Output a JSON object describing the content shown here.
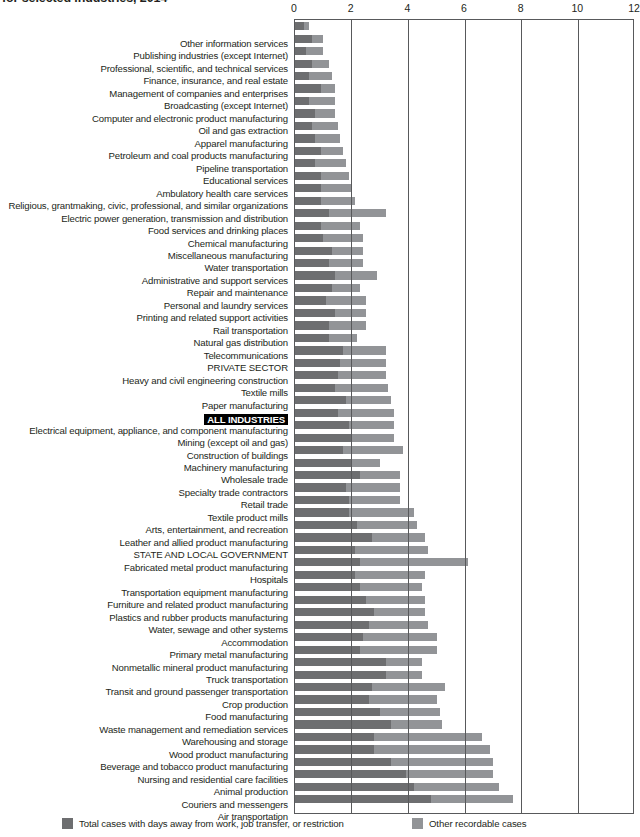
{
  "title": {
    "line_visible": "for selected industries, 2014"
  },
  "legend": {
    "position": "bottom",
    "items": [
      {
        "label": "Total cases with days away from work, job transfer, or restriction",
        "color": "#6d6e70",
        "key": "days_away_transfer_restriction"
      },
      {
        "label": "Other recordable cases",
        "color": "#929497",
        "key": "other_recordable"
      }
    ]
  },
  "axis": {
    "ticks": [
      "0",
      "2",
      "4",
      "6",
      "8",
      "10",
      "12"
    ],
    "min": 0,
    "max": 12,
    "step": 2
  },
  "highlight_category": "ALL INDUSTRIES",
  "chart_data": {
    "type": "bar",
    "orientation": "horizontal",
    "stacked": true,
    "title": "for selected industries, 2014",
    "xlabel": "",
    "ylabel": "",
    "xlim": [
      0,
      12
    ],
    "grid": true,
    "legend_position": "bottom",
    "series": [
      {
        "name": "Total cases with days away from work, job transfer, or restriction",
        "color": "#6d6e70"
      },
      {
        "name": "Other recordable cases",
        "color": "#929497"
      }
    ],
    "categories": [
      "Other information services",
      "Publishing industries (except Internet)",
      "Professional, scientific, and technical services",
      "Finance, insurance, and real estate",
      "Management of companies and enterprises",
      "Broadcasting (except Internet)",
      "Computer and electronic product manufacturing",
      "Oil and gas extraction",
      "Apparel manufacturing",
      "Petroleum and coal products manufacturing",
      "Pipeline transportation",
      "Educational services",
      "Ambulatory health care services",
      "Religious, grantmaking, civic, professional, and similar organizations",
      "Electric power generation, transmission and distribution",
      "Food services and drinking places",
      "Chemical manufacturing",
      "Miscellaneous manufacturing",
      "Water transportation",
      "Administrative and support services",
      "Repair and maintenance",
      "Personal and laundry services",
      "Printing and related support activities",
      "Rail transportation",
      "Natural gas distribution",
      "Telecommunications",
      "PRIVATE SECTOR",
      "Heavy and civil engineering construction",
      "Textile mills",
      "Paper manufacturing",
      "ALL INDUSTRIES",
      "Electrical equipment, appliance, and component manufacturing",
      "Mining (except oil and gas)",
      "Construction of buildings",
      "Machinery manufacturing",
      "Wholesale trade",
      "Specialty trade contractors",
      "Retail trade",
      "Textile product mills",
      "Arts, entertainment, and recreation",
      "Leather and allied product manufacturing",
      "STATE AND LOCAL GOVERNMENT",
      "Fabricated metal product manufacturing",
      "Hospitals",
      "Transportation equipment manufacturing",
      "Furniture and related product manufacturing",
      "Plastics and rubber products manufacturing",
      "Water, sewage and other systems",
      "Accommodation",
      "Primary metal manufacturing",
      "Nonmetallic mineral product manufacturing",
      "Truck transportation",
      "Transit and ground passenger transportation",
      "Crop production",
      "Food manufacturing",
      "Waste management and remediation services",
      "Warehousing and storage",
      "Wood product manufacturing",
      "Beverage and tobacco product manufacturing",
      "Nursing and residential care facilities",
      "Animal production",
      "Couriers and messengers",
      "Air transportation"
    ],
    "values": {
      "days_away_transfer_restriction": [
        0.3,
        0.6,
        0.4,
        0.6,
        0.5,
        0.9,
        0.5,
        0.7,
        0.6,
        0.7,
        0.9,
        0.7,
        0.9,
        0.9,
        0.9,
        1.2,
        0.9,
        1.0,
        1.3,
        1.2,
        1.4,
        1.3,
        1.1,
        1.4,
        1.2,
        1.2,
        1.7,
        1.6,
        1.5,
        1.4,
        1.8,
        1.5,
        1.9,
        2.0,
        1.7,
        2.0,
        2.3,
        1.8,
        1.9,
        1.9,
        2.2,
        2.7,
        2.1,
        2.3,
        2.1,
        2.3,
        2.5,
        2.8,
        2.6,
        2.4,
        2.3,
        3.2,
        3.2,
        2.7,
        2.6,
        3.0,
        3.4,
        2.8,
        2.8,
        3.4,
        3.9,
        4.2,
        4.8
      ],
      "other_recordable": [
        0.2,
        0.4,
        0.6,
        0.6,
        0.8,
        0.5,
        0.9,
        0.7,
        0.9,
        0.9,
        0.8,
        1.1,
        1.0,
        1.1,
        1.2,
        2.0,
        1.4,
        1.4,
        1.1,
        1.2,
        1.5,
        1.0,
        1.4,
        1.1,
        1.3,
        1.0,
        1.5,
        1.6,
        1.7,
        1.9,
        1.6,
        2.0,
        1.6,
        1.5,
        2.1,
        1.0,
        1.4,
        1.9,
        1.8,
        2.3,
        2.1,
        1.9,
        2.6,
        3.8,
        2.5,
        2.2,
        2.1,
        1.8,
        2.1,
        2.6,
        2.7,
        1.3,
        1.3,
        2.6,
        2.4,
        2.1,
        1.8,
        3.8,
        4.1,
        3.6,
        3.1,
        3.0,
        2.9
      ]
    },
    "totals": [
      0.5,
      1.0,
      1.0,
      1.2,
      1.3,
      1.4,
      1.4,
      1.4,
      1.5,
      1.6,
      1.7,
      1.8,
      1.9,
      2.0,
      2.1,
      3.2,
      2.3,
      2.4,
      2.4,
      2.4,
      2.9,
      2.3,
      2.5,
      2.5,
      2.5,
      2.2,
      3.2,
      3.2,
      3.2,
      3.3,
      3.4,
      3.5,
      3.5,
      3.5,
      3.8,
      3.0,
      3.7,
      3.7,
      3.7,
      4.2,
      4.3,
      4.6,
      4.7,
      6.1,
      4.6,
      4.5,
      4.6,
      4.6,
      4.7,
      5.0,
      5.0,
      4.5,
      4.5,
      5.3,
      5.0,
      5.1,
      5.2,
      6.6,
      6.9,
      7.0,
      7.0,
      7.2,
      7.7
    ]
  }
}
